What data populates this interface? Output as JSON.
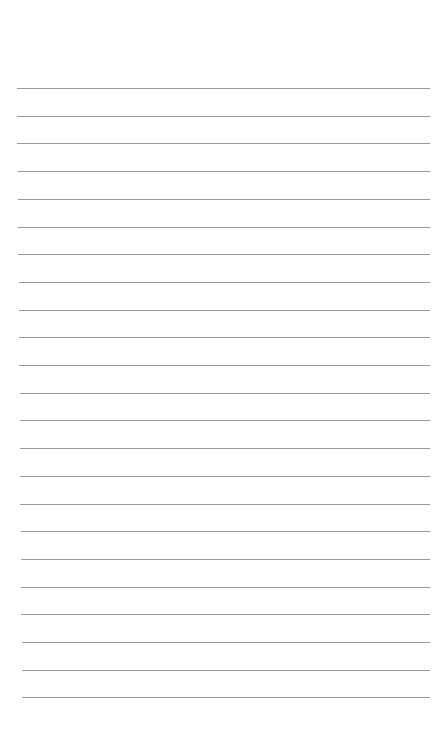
{
  "page": {
    "type": "blank-lined-paper",
    "background_color": "#ffffff",
    "line_color": "#8a8a8a",
    "line_count": 23,
    "first_line_y": 88,
    "line_spacing": 27.7,
    "line_left_top": 17,
    "line_left_bottom": 22,
    "line_right": 430
  }
}
